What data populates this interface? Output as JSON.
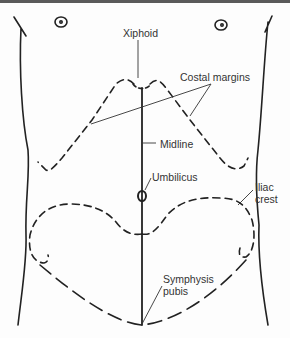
{
  "diagram": {
    "type": "anatomical-landmarks",
    "colors": {
      "line": "#222222",
      "label": "#333333",
      "background": "#fdfdfd",
      "top_border": "#5a5a5a"
    }
  },
  "labels": {
    "xiphoid": "Xiphoid",
    "costal_margins": "Costal margins",
    "midline": "Midline",
    "umbilicus": "Umbilicus",
    "iliac_crest_line1": "Iliac",
    "iliac_crest_line2": "crest",
    "symphysis_line1": "Symphysis",
    "symphysis_line2": "pubis"
  }
}
